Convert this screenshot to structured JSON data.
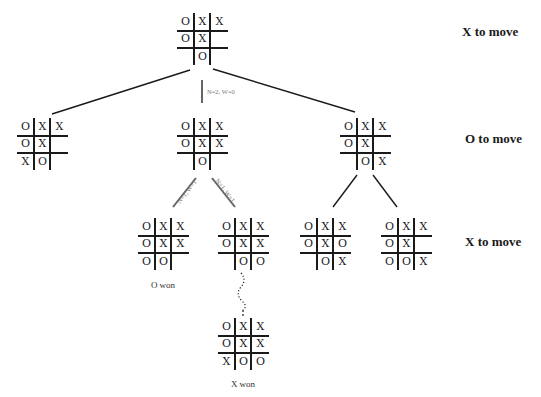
{
  "side_labels": [
    {
      "text": "X to move",
      "x": 462,
      "y": 13
    },
    {
      "text": "O to move",
      "x": 465,
      "y": 131
    },
    {
      "text": "X to move",
      "x": 465,
      "y": 234
    }
  ],
  "edge_labels": {
    "root_to_middle": "N=2, W=0",
    "middle_to_left": "N=1, W=1",
    "middle_to_right": "N=1, W=1"
  },
  "boards": {
    "root": {
      "cells": [
        "O",
        "X",
        "X",
        "O",
        "X",
        "",
        "",
        "O",
        ""
      ]
    },
    "level1_left": {
      "cells": [
        "O",
        "X",
        "X",
        "O",
        "X",
        "",
        "X",
        "O",
        ""
      ]
    },
    "level1_middle": {
      "cells": [
        "O",
        "X",
        "X",
        "O",
        "X",
        "X",
        "",
        "O",
        ""
      ]
    },
    "level1_right": {
      "cells": [
        "O",
        "X",
        "X",
        "O",
        "X",
        "",
        "",
        "O",
        "X"
      ]
    },
    "level2_a": {
      "cells": [
        "O",
        "X",
        "X",
        "O",
        "X",
        "X",
        "O",
        "O",
        ""
      ]
    },
    "level2_b": {
      "cells": [
        "O",
        "X",
        "X",
        "O",
        "X",
        "X",
        "",
        "O",
        "O"
      ]
    },
    "level2_c": {
      "cells": [
        "O",
        "X",
        "X",
        "O",
        "X",
        "O",
        "",
        "O",
        "X"
      ]
    },
    "level2_d": {
      "cells": [
        "O",
        "X",
        "X",
        "O",
        "X",
        "",
        "O",
        "O",
        "X"
      ]
    },
    "terminal": {
      "cells": [
        "O",
        "X",
        "X",
        "O",
        "X",
        "X",
        "X",
        "O",
        "O"
      ]
    }
  },
  "captions": {
    "level2_a": "O won",
    "terminal": "X won"
  },
  "colors": {
    "ink": "#1a1a1a",
    "edge_gray": "#666666",
    "background": "#ffffff"
  }
}
